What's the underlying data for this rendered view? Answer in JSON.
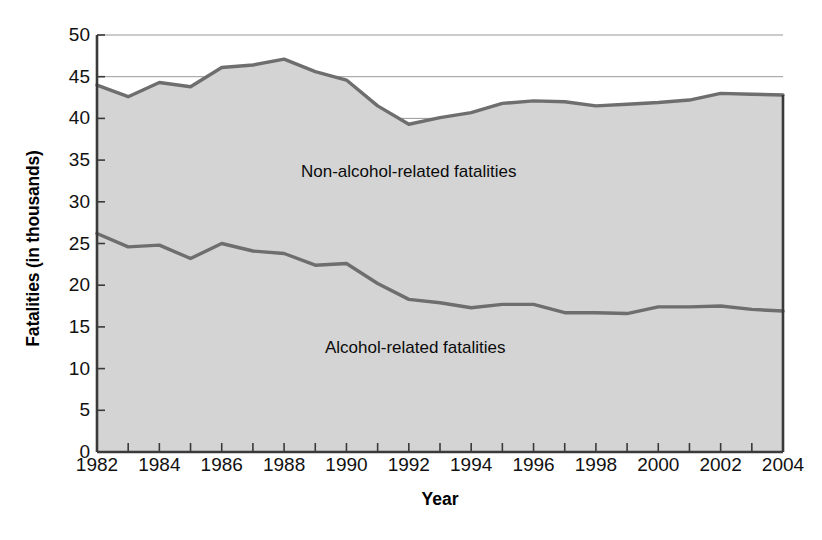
{
  "chart_data": {
    "type": "area",
    "title": "",
    "subtitle": "",
    "xlabel": "Year",
    "ylabel": "Fatalities (in thousands)",
    "stacked": true,
    "grid": true,
    "legend_position": "in-plot-annotation",
    "xlim": [
      1982,
      2004
    ],
    "ylim": [
      0,
      50
    ],
    "y_ticks": [
      0,
      5,
      10,
      15,
      20,
      25,
      30,
      35,
      40,
      45,
      50
    ],
    "y_tick_labels": [
      "0",
      "5",
      "10",
      "15",
      "20",
      "25",
      "30",
      "35",
      "40",
      "45",
      "50"
    ],
    "x_ticks": [
      1982,
      1983,
      1984,
      1985,
      1986,
      1987,
      1988,
      1989,
      1990,
      1991,
      1992,
      1993,
      1994,
      1995,
      1996,
      1997,
      1998,
      1999,
      2000,
      2001,
      2002,
      2003,
      2004
    ],
    "x_tick_labels_shown": [
      "1982",
      "1984",
      "1986",
      "1988",
      "1990",
      "1992",
      "1994",
      "1996",
      "1998",
      "2000",
      "2002",
      "2004"
    ],
    "x": [
      1982,
      1983,
      1984,
      1985,
      1986,
      1987,
      1988,
      1989,
      1990,
      1991,
      1992,
      1993,
      1994,
      1995,
      1996,
      1997,
      1998,
      1999,
      2000,
      2001,
      2002,
      2003,
      2004
    ],
    "series": [
      {
        "name": "Alcohol-related fatalities",
        "annotation": "Alcohol-related fatalities",
        "values": [
          26.2,
          24.6,
          24.8,
          23.2,
          25.0,
          24.1,
          23.8,
          22.4,
          22.6,
          20.2,
          18.3,
          17.9,
          17.3,
          17.7,
          17.7,
          16.7,
          16.7,
          16.6,
          17.4,
          17.4,
          17.5,
          17.1,
          16.9
        ]
      },
      {
        "name": "Non-alcohol-related fatalities",
        "annotation": "Non-alcohol-related fatalities",
        "cumulative_values": [
          44.0,
          42.6,
          44.3,
          43.8,
          46.1,
          46.4,
          47.1,
          45.6,
          44.6,
          41.5,
          39.3,
          40.1,
          40.7,
          41.8,
          42.1,
          42.0,
          41.5,
          41.7,
          41.9,
          42.2,
          43.0,
          42.9,
          42.8
        ],
        "values": [
          17.8,
          18.0,
          19.5,
          20.6,
          21.1,
          22.3,
          23.3,
          23.2,
          22.0,
          21.3,
          21.0,
          22.2,
          23.4,
          24.1,
          24.4,
          25.3,
          24.8,
          25.1,
          24.5,
          24.8,
          25.5,
          25.8,
          25.9
        ]
      }
    ]
  },
  "colors": {
    "area_fill": "#d4d4d4",
    "line": "#6e6e6e",
    "axis": "#3a3a3a",
    "gridline": "#8d8d8d",
    "text": "#111111",
    "background": "#ffffff"
  }
}
